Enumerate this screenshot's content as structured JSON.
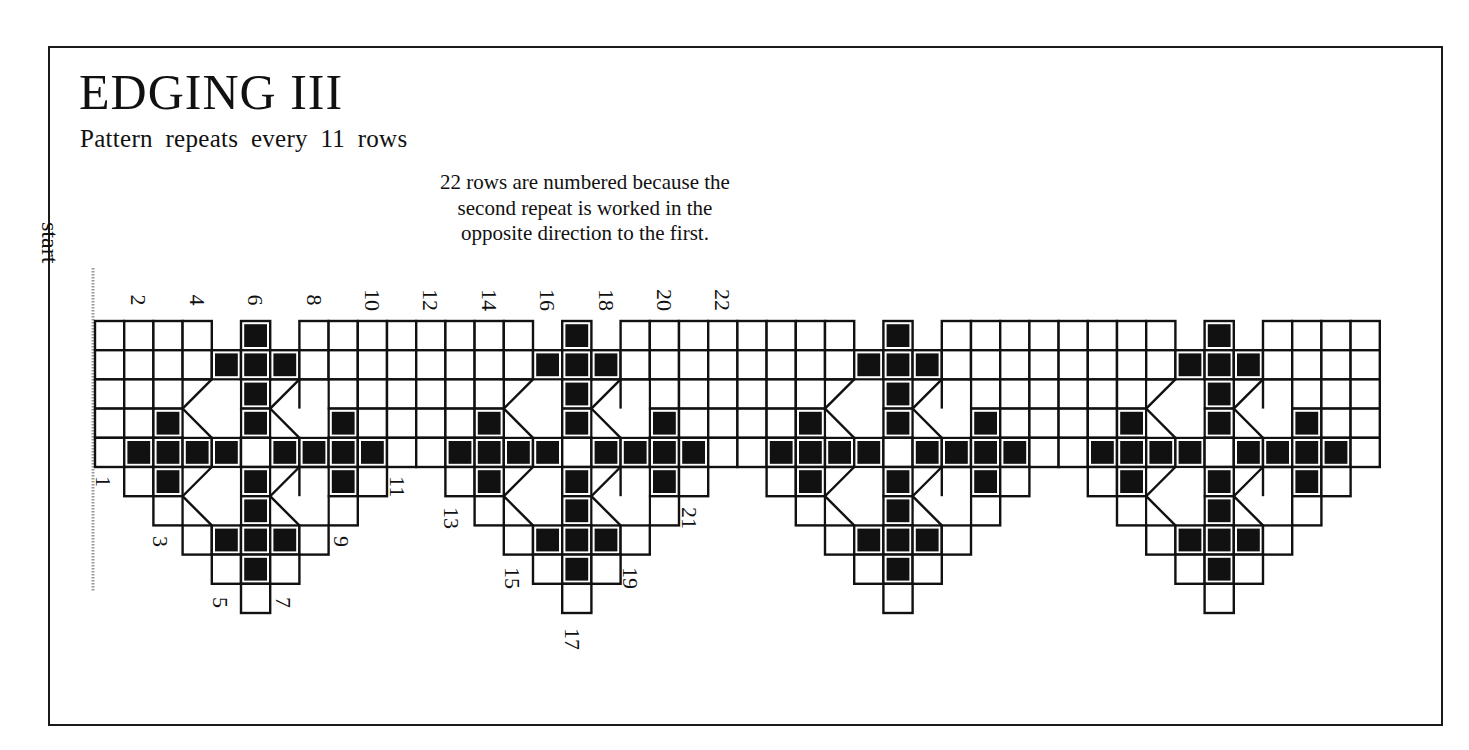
{
  "header": {
    "title": "EDGING III",
    "subtitle": "Pattern repeats every 11 rows"
  },
  "note": {
    "lines": [
      "22 rows are numbered because the",
      "second repeat is worked in the",
      "opposite direction to the first."
    ]
  },
  "start_label": "start",
  "colors": {
    "ink": "#111111",
    "paper": "#ffffff",
    "frame": "#1a1a1a",
    "start_line": "#9a9a9a"
  },
  "chart": {
    "origin_x": 95,
    "origin_y": 321,
    "cell": 29.2,
    "columns": 44,
    "motif_width": 11,
    "motif_centers": [
      5,
      16,
      27,
      38
    ],
    "motif_rows": [
      {
        "row": 0,
        "span": "full",
        "filled": [
          0
        ],
        "open": [
          -1,
          1
        ]
      },
      {
        "row": 1,
        "span": "full",
        "filled": [
          -1,
          0,
          1
        ],
        "open": []
      },
      {
        "row": 2,
        "span": "full",
        "filled": [
          0
        ],
        "open": [
          -2,
          -1,
          1,
          2
        ]
      },
      {
        "row": 3,
        "span": "full",
        "filled": [
          -3,
          0,
          3
        ],
        "open": [
          -2,
          -1,
          1,
          2
        ]
      },
      {
        "row": 4,
        "span": "full",
        "filled": [
          -4,
          -3,
          -2,
          -1,
          1,
          2,
          3,
          4
        ],
        "open": []
      },
      {
        "row": 5,
        "span": [
          -4,
          4
        ],
        "filled": [
          -3,
          0,
          3
        ],
        "open": [
          -2,
          -1,
          1,
          2
        ]
      },
      {
        "row": 6,
        "span": [
          -3,
          3
        ],
        "filled": [
          0
        ],
        "open": [
          -2,
          -1,
          1,
          2
        ]
      },
      {
        "row": 7,
        "span": [
          -2,
          2
        ],
        "filled": [
          -1,
          0,
          1
        ],
        "open": []
      },
      {
        "row": 8,
        "span": [
          -1,
          1
        ],
        "filled": [
          0
        ],
        "open": []
      },
      {
        "row": 9,
        "span": [
          0,
          0
        ],
        "filled": [],
        "open": []
      }
    ],
    "top_labels": [
      {
        "text": "2",
        "col": 1
      },
      {
        "text": "4",
        "col": 3
      },
      {
        "text": "6",
        "col": 5
      },
      {
        "text": "8",
        "col": 7
      },
      {
        "text": "10",
        "col": 9
      },
      {
        "text": "12",
        "col": 11
      },
      {
        "text": "14",
        "col": 13
      },
      {
        "text": "16",
        "col": 15
      },
      {
        "text": "18",
        "col": 17
      },
      {
        "text": "20",
        "col": 19
      },
      {
        "text": "22",
        "col": 21
      }
    ],
    "bottom_labels": [
      {
        "text": "1",
        "x": 103,
        "y": 476
      },
      {
        "text": "3",
        "x": 160,
        "y": 536
      },
      {
        "text": "5",
        "x": 220,
        "y": 597
      },
      {
        "text": "7",
        "x": 283,
        "y": 597
      },
      {
        "text": "9",
        "x": 341,
        "y": 536
      },
      {
        "text": "11",
        "x": 397,
        "y": 476
      },
      {
        "text": "13",
        "x": 451,
        "y": 507
      },
      {
        "text": "15",
        "x": 512,
        "y": 567
      },
      {
        "text": "17",
        "x": 572,
        "y": 628
      },
      {
        "text": "19",
        "x": 630,
        "y": 567
      },
      {
        "text": "21",
        "x": 689,
        "y": 507
      }
    ],
    "start_line": {
      "x": 93,
      "y1": 268,
      "y2": 592
    }
  }
}
